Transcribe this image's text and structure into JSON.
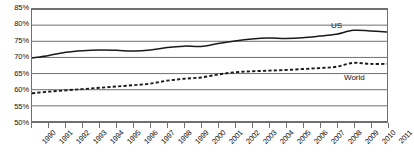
{
  "chart_data": {
    "type": "line",
    "title": "",
    "xlabel": "",
    "ylabel": "",
    "ylim": [
      50,
      85
    ],
    "ytick_step": 5,
    "grid": true,
    "legend_position": "inline-annotation",
    "categories": [
      "1990",
      "1991",
      "1992",
      "1993",
      "1994",
      "1995",
      "1996",
      "1997",
      "1998",
      "1999",
      "2000",
      "2001",
      "2002",
      "2003",
      "2004",
      "2005",
      "2006",
      "2007",
      "2008",
      "2009",
      "2010",
      "2011"
    ],
    "yticks": [
      "50%",
      "55%",
      "60%",
      "65%",
      "70%",
      "75%",
      "80%",
      "85%"
    ],
    "series": [
      {
        "name": "US",
        "style": "solid",
        "color": "#1a1a1a",
        "label": "US",
        "values": [
          69.8,
          70.6,
          71.6,
          72.1,
          72.3,
          72.2,
          72.0,
          72.3,
          73.1,
          73.5,
          73.4,
          74.3,
          75.1,
          75.7,
          76.0,
          75.9,
          76.1,
          76.6,
          77.2,
          78.4,
          78.2,
          77.9
        ]
      },
      {
        "name": "World",
        "style": "dotted",
        "color": "#1a1a1a",
        "label": "World",
        "values": [
          58.9,
          59.4,
          59.8,
          60.2,
          60.6,
          61.0,
          61.4,
          61.9,
          62.8,
          63.4,
          63.8,
          64.7,
          65.4,
          65.7,
          65.9,
          66.1,
          66.4,
          66.7,
          67.1,
          68.3,
          68.0,
          68.0
        ]
      }
    ]
  }
}
